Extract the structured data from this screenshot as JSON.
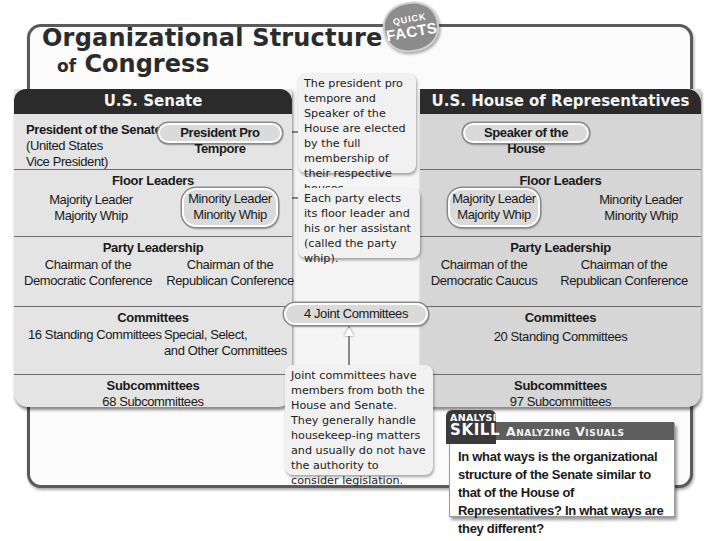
{
  "header": {
    "title_line1": "Organizational Structure",
    "title_line2_prefix": "of",
    "title_line2": "Congress",
    "badge_top": "QUICK",
    "badge_bottom": "FACTS"
  },
  "senate": {
    "heading": "U.S. Senate",
    "leader": {
      "title": "President of the Senate",
      "detail_line1": "(United States",
      "detail_line2": "Vice President)",
      "pill": "President Pro Tempore"
    },
    "floor_leaders": {
      "title": "Floor Leaders",
      "left_line1": "Majority Leader",
      "left_line2": "Majority Whip",
      "right_line1": "Minority Leader",
      "right_line2": "Minority Whip"
    },
    "party_leadership": {
      "title": "Party Leadership",
      "left_line1": "Chairman of the",
      "left_line2": "Democratic Conference",
      "right_line1": "Chairman of the",
      "right_line2": "Republican Conference"
    },
    "committees": {
      "title": "Committees",
      "left": "16 Standing Committees",
      "right_line1": "Special, Select,",
      "right_line2": "and Other Committees"
    },
    "subcommittees": {
      "title": "Subcommittees",
      "value": "68 Subcommittees"
    }
  },
  "house": {
    "heading": "U.S. House of Representatives",
    "leader": {
      "pill": "Speaker of the House"
    },
    "floor_leaders": {
      "title": "Floor Leaders",
      "left_line1": "Majority Leader",
      "left_line2": "Majority Whip",
      "right_line1": "Minority Leader",
      "right_line2": "Minority Whip"
    },
    "party_leadership": {
      "title": "Party Leadership",
      "left_line1": "Chairman of the",
      "left_line2": "Democratic Caucus",
      "right_line1": "Chairman of the",
      "right_line2": "Republican Conference"
    },
    "committees": {
      "title": "Committees",
      "value": "20 Standing Committees"
    },
    "subcommittees": {
      "title": "Subcommittees",
      "value": "97 Subcommittees"
    }
  },
  "joint": {
    "pill": "4 Joint Committees"
  },
  "callouts": {
    "leaders": "The president pro tempore and Speaker of the House are elected by the full membership of their respective houses.",
    "floor": "Each party elects its floor leader and his or her assistant (called the party whip).",
    "joint": "Joint committees have members from both the House and Senate. They generally handle housekeep-ing matters and usually do not have the authority to consider legislation."
  },
  "analysis": {
    "badge_top": "ANALYSIS",
    "badge_bottom": "SKILL",
    "title": "Analyzing Visuals",
    "question": "In what ways is the organizational structure of the Senate similar to that of the House of Representatives? In what ways are they different?"
  },
  "colors": {
    "panel_header": "#2b2b2b",
    "senate_panel": "#e4e4e4",
    "house_panel": "#d6d6d6",
    "callout_bg": "#f1f1f1",
    "badge_gray": "#8c8c8c"
  }
}
